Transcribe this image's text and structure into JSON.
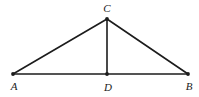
{
  "figure": {
    "background_color": "#ffffff",
    "stroke_color": "#1c1c1c",
    "stroke_width": 1.6,
    "width": 199,
    "height": 97,
    "points": {
      "A": {
        "label": "A",
        "x": 13,
        "y": 74,
        "label_x": 14,
        "label_y": 90
      },
      "B": {
        "label": "B",
        "x": 188,
        "y": 74,
        "label_x": 189,
        "label_y": 90
      },
      "C": {
        "label": "C",
        "x": 107,
        "y": 19,
        "label_x": 107,
        "label_y": 12
      },
      "D": {
        "label": "D",
        "x": 107,
        "y": 74,
        "label_x": 108,
        "label_y": 91
      }
    },
    "segments": [
      {
        "name": "segment-AB",
        "from": "A",
        "to": "B"
      },
      {
        "name": "segment-AC",
        "from": "A",
        "to": "C"
      },
      {
        "name": "segment-CB",
        "from": "C",
        "to": "B"
      },
      {
        "name": "segment-CD",
        "from": "C",
        "to": "D"
      }
    ],
    "vertex_dot_radius": 1.9
  }
}
